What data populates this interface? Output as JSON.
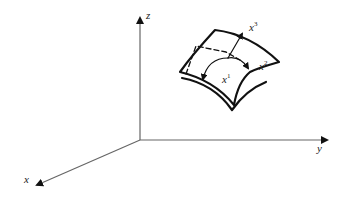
{
  "diagram": {
    "type": "3D coordinate system with curved surface element",
    "axes": {
      "x": "x",
      "y": "y",
      "z": "z"
    },
    "surface": {
      "curvilinear_coordinates": [
        {
          "base": "x",
          "superscript": "1"
        },
        {
          "base": "x",
          "superscript": "2"
        },
        {
          "base": "x",
          "superscript": "3"
        }
      ]
    },
    "colors": {
      "axis": "#555555",
      "surface": "#111111",
      "background": "#ffffff"
    }
  }
}
